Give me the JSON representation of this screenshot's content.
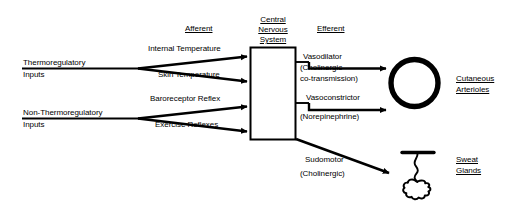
{
  "diagram": {
    "headers": {
      "afferent": "Afferent",
      "efferent": "Efferent"
    },
    "center": {
      "line1": "Central",
      "line2": "Nervous",
      "line3": "System"
    },
    "inputs": [
      {
        "name": "thermoregulatory",
        "line1": "Thermoregulatory",
        "line2": "Inputs",
        "branches": [
          "Internal Temperature",
          "Skin Temperature"
        ]
      },
      {
        "name": "non-thermoregulatory",
        "line1": "Non-Thermoregulatory",
        "line2": "Inputs",
        "branches": [
          "Baroreceptor Reflex",
          "Exercise Reflexes"
        ]
      }
    ],
    "efferents": [
      {
        "name": "vasodilator",
        "line1": "Vasodilator",
        "line2": "(Cholinergic",
        "line3": "co-transmission)"
      },
      {
        "name": "vasoconstrictor",
        "line1": "Vasoconstrictor",
        "line2": "(Norepinephrine)",
        "line3": ""
      },
      {
        "name": "sudomotor",
        "line1": "Sudomotor",
        "line2": "(Cholinergic)",
        "line3": ""
      }
    ],
    "targets": [
      {
        "name": "cutaneous-arterioles",
        "icon": "circle-vessel-icon",
        "line1": "Cutaneous",
        "line2": "Arterioles"
      },
      {
        "name": "sweat-glands",
        "icon": "sweat-gland-icon",
        "line1": "Sweat",
        "line2": "Glands"
      }
    ],
    "colors": {
      "ink": "#000000",
      "background": "#ffffff"
    }
  }
}
